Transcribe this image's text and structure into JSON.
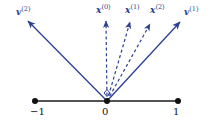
{
  "figure": {
    "background_color": "#ffffff",
    "vector_color": "#2b3f93",
    "axis_color": "#1a1a1a",
    "width": 217,
    "height": 127
  },
  "axis": {
    "name": "number-line",
    "y": 101,
    "x_start": 35,
    "x_end": 178,
    "ticks": [
      {
        "label": "−1",
        "x": 35,
        "value": -1
      },
      {
        "label": "0",
        "x": 107,
        "value": 0
      },
      {
        "label": "1",
        "x": 178,
        "value": 1
      }
    ]
  },
  "origin": {
    "x": 107,
    "y": 101
  },
  "right_angle_marker": {
    "name": "right-angle-marker",
    "shape": "diamond",
    "x": 107,
    "y": 93
  },
  "vectors": [
    {
      "id": "v2",
      "label_text": "v",
      "label_sup": "(2)",
      "style": "solid",
      "tip_x": 28,
      "tip_y": 21,
      "label_x": 16,
      "label_y": 8
    },
    {
      "id": "x0",
      "label_text": "x",
      "label_sup": "(0)",
      "style": "dashed",
      "tip_x": 106,
      "tip_y": 21,
      "label_x": 96,
      "label_y": 6
    },
    {
      "id": "x1",
      "label_text": "x",
      "label_sup": "(1)",
      "style": "dashed",
      "tip_x": 130,
      "tip_y": 22,
      "label_x": 125,
      "label_y": 6
    },
    {
      "id": "x2",
      "label_text": "x",
      "label_sup": "(2)",
      "style": "dashed",
      "tip_x": 150,
      "tip_y": 24,
      "label_x": 150,
      "label_y": 6
    },
    {
      "id": "v1",
      "label_text": "v",
      "label_sup": "(1)",
      "style": "solid",
      "tip_x": 180,
      "tip_y": 22,
      "label_x": 184,
      "label_y": 8
    }
  ]
}
